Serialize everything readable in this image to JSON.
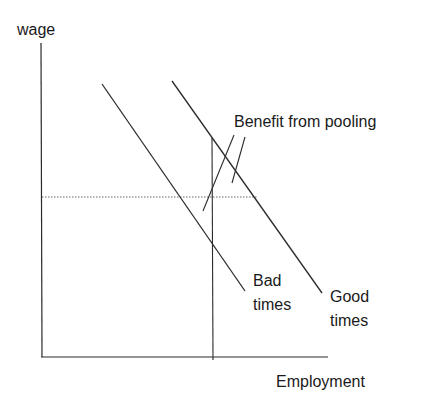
{
  "diagram": {
    "type": "labor-demand-shift",
    "axes": {
      "y_label": "wage",
      "x_label": "Employment"
    },
    "curves": [
      {
        "name": "bad-times",
        "label_line1": "Bad",
        "label_line2": "times",
        "from": [
          102,
          84
        ],
        "to": [
          245,
          291
        ]
      },
      {
        "name": "good-times",
        "label_line1": "Good",
        "label_line2": "times",
        "from": [
          172,
          81
        ],
        "to": [
          322,
          293
        ]
      }
    ],
    "annotation": {
      "text": "Benefit from pooling"
    },
    "reference_lines": {
      "wage_level": "dotted horizontal",
      "employment_level": "solid vertical"
    },
    "colors": {
      "line": "#2b2b2b",
      "text": "#1a1a1a",
      "dotted": "#666666",
      "background": "#ffffff"
    }
  }
}
